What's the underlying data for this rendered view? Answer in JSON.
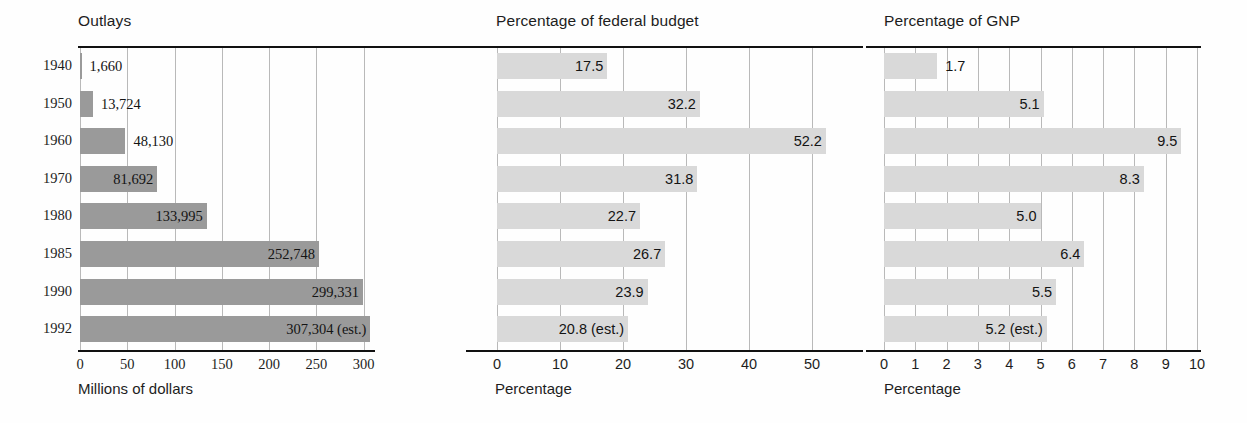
{
  "figure": {
    "background": "#ffffff",
    "bar_color_outlays": "#9a9a9a",
    "bar_color_percentage": "#d9d9d9",
    "gridline_color": "#b9b9b9",
    "rule_color": "#111111"
  },
  "years": [
    "1940",
    "1950",
    "1960",
    "1970",
    "1980",
    "1985",
    "1990",
    "1992"
  ],
  "panels": {
    "outlays": {
      "title": "Outlays",
      "axis_caption": "Millions of dollars",
      "ticks": [
        "0",
        "50",
        "100",
        "150",
        "200",
        "250",
        "300"
      ],
      "labels": [
        "1,660",
        "13,724",
        "48,130",
        "81,692",
        "133,995",
        "252,748",
        "299,331",
        "307,304 (est.)"
      ]
    },
    "federal_budget": {
      "title": "Percentage of federal budget",
      "axis_caption": "Percentage",
      "ticks": [
        "0",
        "10",
        "20",
        "30",
        "40",
        "50"
      ],
      "labels": [
        "17.5",
        "32.2",
        "52.2",
        "31.8",
        "22.7",
        "26.7",
        "23.9",
        "20.8 (est.)"
      ]
    },
    "gnp": {
      "title": "Percentage of GNP",
      "axis_caption": "Percentage",
      "ticks": [
        "0",
        "1",
        "2",
        "3",
        "4",
        "5",
        "6",
        "7",
        "8",
        "9",
        "10"
      ],
      "labels": [
        "1.7",
        "5.1",
        "9.5",
        "8.3",
        "5.0",
        "6.4",
        "5.5",
        "5.2 (est.)"
      ]
    }
  },
  "chart_data": {
    "type": "bar",
    "orientation": "horizontal",
    "categories": [
      "1940",
      "1950",
      "1960",
      "1970",
      "1980",
      "1985",
      "1990",
      "1992"
    ],
    "xlabel": "",
    "ylabel": "",
    "grid": true,
    "legend": "none",
    "panels": [
      {
        "title": "Outlays",
        "xlabel": "Millions of dollars",
        "xlim": [
          0,
          310
        ],
        "xticks": [
          0,
          50,
          100,
          150,
          200,
          250,
          300
        ],
        "bar_color": "#9a9a9a",
        "values": [
          1660,
          13724,
          48130,
          81692,
          133995,
          252748,
          299331,
          307304
        ],
        "plotted_values": [
          1.66,
          13.724,
          48.13,
          81.692,
          133.995,
          252.748,
          299.331,
          307.304
        ],
        "value_labels": [
          "1,660",
          "13,724",
          "48,130",
          "81,692",
          "133,995",
          "252,748",
          "299,331",
          "307,304 (est.)"
        ]
      },
      {
        "title": "Percentage of federal budget",
        "xlabel": "Percentage",
        "xlim": [
          0,
          55
        ],
        "xticks": [
          0,
          10,
          20,
          30,
          40,
          50
        ],
        "bar_color": "#d9d9d9",
        "values": [
          17.5,
          32.2,
          52.2,
          31.8,
          22.7,
          26.7,
          23.9,
          20.8
        ],
        "value_labels": [
          "17.5",
          "32.2",
          "52.2",
          "31.8",
          "22.7",
          "26.7",
          "23.9",
          "20.8 (est.)"
        ]
      },
      {
        "title": "Percentage of GNP",
        "xlabel": "Percentage",
        "xlim": [
          0,
          10
        ],
        "xticks": [
          0,
          1,
          2,
          3,
          4,
          5,
          6,
          7,
          8,
          9,
          10
        ],
        "bar_color": "#d9d9d9",
        "values": [
          1.7,
          5.1,
          9.5,
          8.3,
          5.0,
          6.4,
          5.5,
          5.2
        ],
        "value_labels": [
          "1.7",
          "5.1",
          "9.5",
          "8.3",
          "5.0",
          "6.4",
          "5.5",
          "5.2 (est.)"
        ]
      }
    ]
  }
}
